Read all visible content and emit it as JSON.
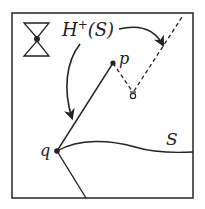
{
  "diagram": {
    "labels": {
      "horizon": "H",
      "horizon_sup": "+",
      "horizon_arg": "(S)",
      "point_p": "p",
      "point_q": "q",
      "surface": "S"
    },
    "icons": [
      "light-cone-icon",
      "small-light-cone-icon"
    ],
    "colors": {
      "stroke": "#222222",
      "background": "#ffffff"
    }
  }
}
